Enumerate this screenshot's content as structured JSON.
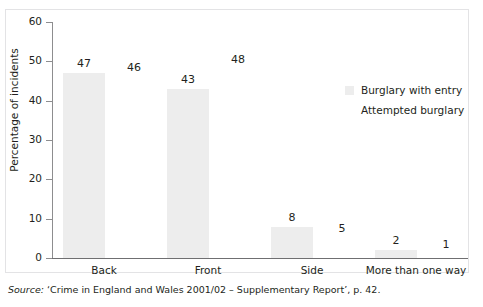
{
  "chart_data": {
    "type": "bar",
    "title": "",
    "subtitle": "",
    "xlabel": "",
    "ylabel": "Percentage of incidents",
    "ylim": [
      0,
      60
    ],
    "ytick_values": [
      0,
      10,
      20,
      30,
      40,
      50,
      60
    ],
    "ytick_labels": [
      "0",
      "10",
      "20",
      "30",
      "40",
      "50",
      "60"
    ],
    "grid": false,
    "legend_position": "right",
    "categories": [
      "Back",
      "Front",
      "Side",
      "More than one way"
    ],
    "series": [
      {
        "name": "Burglary with entry",
        "color": "#ededed",
        "drawn_as_bars": true,
        "values": [
          47,
          43,
          8,
          2
        ],
        "value_labels": [
          "47",
          "43",
          "8",
          "2"
        ]
      },
      {
        "name": "Attempted burglary",
        "color": "#ffffff",
        "drawn_as_bars": false,
        "values": [
          46,
          48,
          5,
          1
        ],
        "value_labels": [
          "46",
          "48",
          "5",
          "1"
        ]
      }
    ]
  },
  "legend": {
    "items": [
      {
        "label": "Burglary with entry",
        "swatch_color": "#ededed"
      },
      {
        "label": "Attempted burglary",
        "swatch_color": "#ffffff"
      }
    ]
  },
  "source": {
    "prefix": "Source:",
    "text": " ‘Crime in England and Wales 2001/02 – Supplementary Report’, p. 42."
  },
  "colors": {
    "bar_fill": "#ededed",
    "axis": "#6f6f71",
    "text": "#231f20",
    "frame": "#e3e3e5",
    "background": "#ffffff"
  }
}
